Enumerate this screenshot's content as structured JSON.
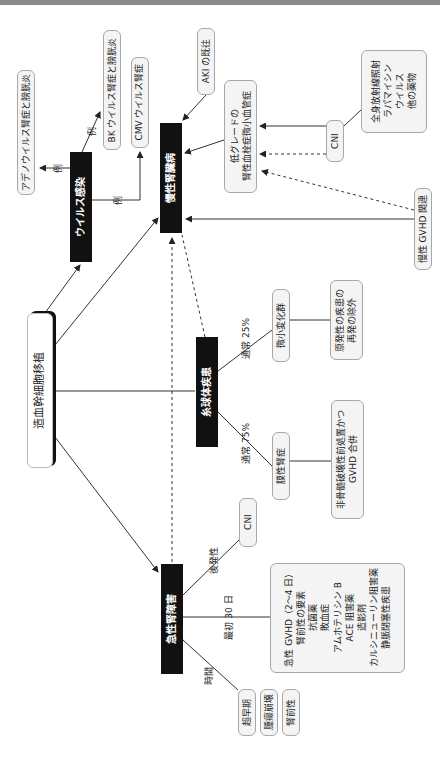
{
  "root": {
    "label": "造血幹細胞移植"
  },
  "categories": {
    "viral_infection": "ウイルス感染",
    "ckd": "慢性腎臓病",
    "glomerular": "糸球体疾患",
    "aki": "急性腎障害"
  },
  "viral_examples": {
    "adeno": "アデノウイルス腎症と膀胱炎",
    "bk": "BK ウイルス腎症と膀胱炎",
    "cmv": "CMV ウイルス腎症",
    "edge_label": "例"
  },
  "ckd_causes": {
    "aki_history": "AKI の既往",
    "tma_line1": "低グレードの",
    "tma_line2": "腎性血栓症微小血管症",
    "cni": "CNI",
    "other_causes": [
      "全身放射線照射",
      "ラパマイシン",
      "ウイルス",
      "他の薬物"
    ],
    "chronic_gvhd": "慢性 GVHD 関連"
  },
  "glomerular_branches": {
    "minimal_change": {
      "edge_label": "通常 25%",
      "label": "微小変化群",
      "note": [
        "原発性の疾患の",
        "再発の除外"
      ]
    },
    "membranous": {
      "edge_label": "通常 75%",
      "label": "膜性腎症",
      "note": [
        "非骨髄破壊性前処置かつ",
        "GVHD 合併"
      ]
    }
  },
  "aki_branches": {
    "late": {
      "edge_label": "後発性",
      "label": "CNI"
    },
    "first30": {
      "edge_label": "最初 30 日",
      "items": [
        "急性 GVHD（2～4 日）",
        "腎前性の要素",
        "抗菌薬",
        "敗血症",
        "アムホテリシン B",
        "ACE 阻害薬",
        "造影剤",
        "カルシニューリン阻害薬",
        "静脈閉塞性疾患"
      ]
    },
    "time": {
      "edge_label": "時間",
      "items": [
        "超早期",
        "腫瘍崩壊",
        "腎前性"
      ]
    }
  },
  "colors": {
    "black_box": "#111111",
    "box_fill": "#f4f4f4",
    "box_border": "#a8a8a8",
    "line": "#333333",
    "top_bar": "#8a8a8a"
  }
}
